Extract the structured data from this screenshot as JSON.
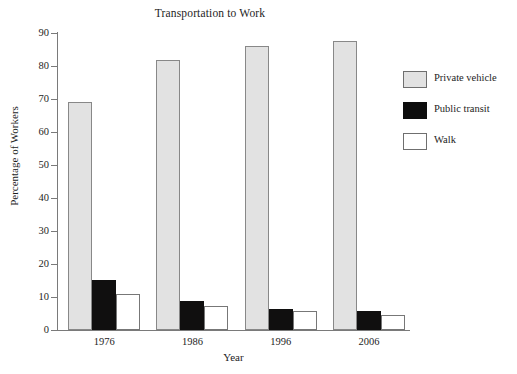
{
  "chart_data": {
    "type": "bar",
    "title": "Transportation to Work",
    "xlabel": "Year",
    "ylabel": "Percentage of Workers",
    "categories": [
      "1976",
      "1986",
      "1996",
      "2006"
    ],
    "series": [
      {
        "name": "Private vehicle",
        "color": "#e2e2e2",
        "values": [
          69.2,
          81.8,
          86.0,
          87.6
        ]
      },
      {
        "name": "Public transit",
        "color": "#100f0f",
        "values": [
          15.3,
          8.7,
          6.4,
          5.7
        ]
      },
      {
        "name": "Walk",
        "color": "#ffffff",
        "values": [
          10.8,
          7.4,
          5.8,
          4.7
        ]
      }
    ],
    "ylim": [
      0,
      90
    ],
    "yticks": [
      0,
      10,
      20,
      30,
      40,
      50,
      60,
      70,
      80,
      90
    ],
    "ytick_labels": [
      "0",
      "10",
      "20",
      "30",
      "40",
      "50",
      "60",
      "70",
      "80",
      "90"
    ],
    "grid": false,
    "legend_position": "right",
    "legend_entries": [
      "Private vehicle",
      "Public transit",
      "Walk"
    ]
  }
}
